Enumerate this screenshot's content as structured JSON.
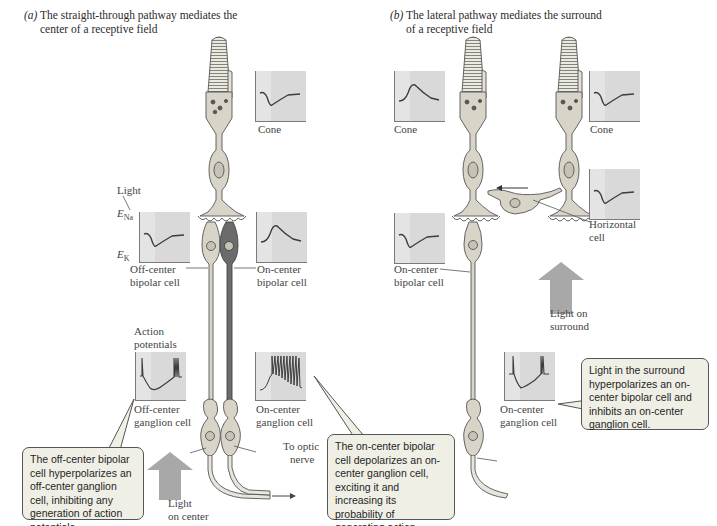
{
  "panel_a": {
    "letter": "(a)",
    "title_line1": "The straight-through pathway mediates the",
    "title_line2": "center of a receptive field",
    "labels": {
      "cone": "Cone",
      "light": "Light",
      "e_na": "E",
      "e_na_sub": "Na",
      "e_k": "E",
      "e_k_sub": "K",
      "off_bipolar_line1": "Off-center",
      "off_bipolar_line2": "bipolar cell",
      "on_bipolar_line1": "On-center",
      "on_bipolar_line2": "bipolar cell",
      "action_line1": "Action",
      "action_line2": "potentials",
      "off_ganglion_line1": "Off-center",
      "off_ganglion_line2": "ganglion cell",
      "on_ganglion_line1": "On-center",
      "on_ganglion_line2": "ganglion cell",
      "optic_line1": "To optic",
      "optic_line2": "nerve",
      "light_center_line1": "Light",
      "light_center_line2": "on center"
    },
    "callout_off": "The off-center bipolar cell hyperpolarizes an off-center ganglion cell, inhibiting any generation of action potentials.",
    "callout_on": "The on-center bipolar cell depolarizes an on-center ganglion cell, exciting it and increasing its probability of generating action potentials."
  },
  "panel_b": {
    "letter": "(b)",
    "title_line1": "The lateral pathway mediates the surround",
    "title_line2": "of a receptive field",
    "labels": {
      "cone_left": "Cone",
      "cone_right": "Cone",
      "horizontal_line1": "Horizontal",
      "horizontal_line2": "cell",
      "on_bipolar_line1": "On-center",
      "on_bipolar_line2": "bipolar cell",
      "light_surround_line1": "Light on",
      "light_surround_line2": "surround",
      "on_ganglion_line1": "On-center",
      "on_ganglion_line2": "ganglion cell"
    },
    "callout": "Light in the surround hyperpolarizes an on-center bipolar cell and inhibits an on-center ganglion cell."
  },
  "colors": {
    "graph_bg": "#dcdcdc",
    "trace": "#3d3d3d",
    "cell_fill": "#d8d4c8",
    "callout_bg": "#f0efe6",
    "arrow_gray": "#a8a8a8"
  }
}
